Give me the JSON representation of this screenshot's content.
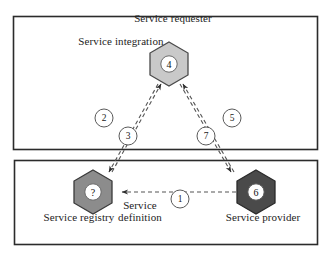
{
  "diagram": {
    "boxes": [
      {
        "name": "service-integration-box"
      },
      {
        "name": "service-registry-provider-box"
      }
    ],
    "labels": {
      "service_integration": "Service integration",
      "service_requester": "Service requester",
      "service_registry": "Service registry",
      "service_provider": "Service provider",
      "service_definition": "Service definition"
    },
    "nodes": [
      {
        "id": "requester",
        "label": "Service requester",
        "badge": "4",
        "fill": "#c9c9c9",
        "stroke": "#4a4a4a"
      },
      {
        "id": "registry",
        "label": "Service registry",
        "badge": "?",
        "fill": "#8c8c8c",
        "stroke": "#3a3a3a"
      },
      {
        "id": "provider",
        "label": "Service provider",
        "badge": "6",
        "fill": "#4a4a4a",
        "stroke": "#2a2a2a"
      }
    ],
    "step_markers": [
      {
        "id": "step-1",
        "label": "1"
      },
      {
        "id": "step-2",
        "label": "2"
      },
      {
        "id": "step-3",
        "label": "3"
      },
      {
        "id": "step-5",
        "label": "5"
      },
      {
        "id": "step-7",
        "label": "7"
      }
    ],
    "connections": [
      {
        "from": "provider",
        "to": "registry",
        "style": "dashed",
        "steps": [
          "1"
        ]
      },
      {
        "from": "registry",
        "to": "requester",
        "style": "dashed",
        "steps": [
          "2",
          "3"
        ]
      },
      {
        "from": "requester",
        "to": "provider",
        "style": "dashed",
        "steps": [
          "5",
          "7"
        ]
      }
    ],
    "colors": {
      "frame": "#2b2b2b",
      "line": "#555555",
      "background": "#ffffff",
      "badge_fill": "#ffffff"
    }
  }
}
